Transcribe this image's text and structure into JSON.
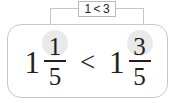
{
  "callout": {
    "label": "1 < 3",
    "border_color": "#b9b9b9",
    "leader_color": "#c6c6c6"
  },
  "card": {
    "border_color": "#c9c9c9",
    "background": "#ffffff"
  },
  "expression": {
    "comparison_operator": "<",
    "left": {
      "whole": "1",
      "numerator": "1",
      "denominator": "5",
      "numerator_highlighted": true
    },
    "right": {
      "whole": "1",
      "numerator": "3",
      "denominator": "5",
      "numerator_highlighted": true
    }
  },
  "colors": {
    "text": "#231f20",
    "highlight": "#e9e9e9"
  }
}
